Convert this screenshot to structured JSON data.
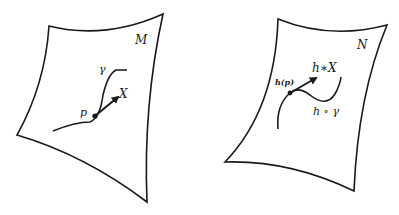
{
  "diagram": {
    "type": "differential-geometry-pushforward",
    "left_manifold": {
      "name": "M",
      "curve_label": "γ",
      "point_label": "p",
      "vector_label": "X"
    },
    "right_manifold": {
      "name": "N",
      "curve_label": "h ∘ γ",
      "point_label": "h(p)",
      "vector_label": "h∗X"
    },
    "colors": {
      "stroke": "#1a1a1a",
      "background": "#ffffff"
    }
  }
}
